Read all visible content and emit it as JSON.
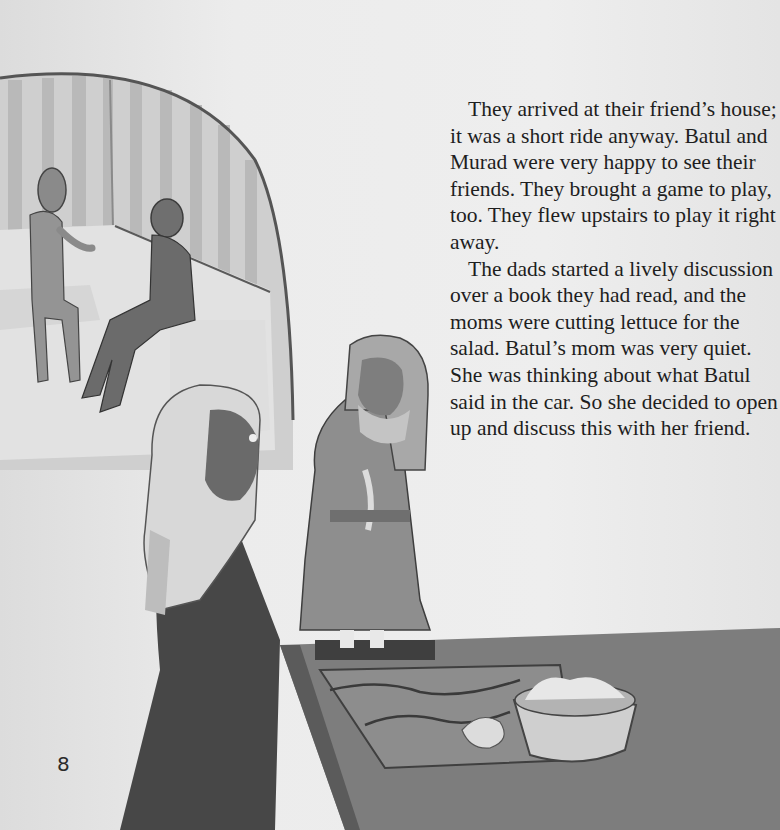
{
  "page": {
    "number": "8",
    "color_mode": "grayscale",
    "background": "#e9e9e9"
  },
  "story": {
    "paragraphs": [
      "They arrived at their friend’s house; it was a short ride anyway. Batul and Murad were very happy to see their friends. They brought a game to play, too. They flew upstairs to play it right away.",
      "The dads started a lively discussion over a book they had read, and the moms were cutting lettuce for the salad. Batul’s mom was very quiet. She was thinking about what Batul said in the car. So she decided to open up and discuss this with her friend."
    ]
  },
  "illustration": {
    "scene": "kitchen with two women in headscarves at a counter; arched doorway showing two men talking on a sofa",
    "elements": [
      "arched-doorway",
      "two-men-on-sofa",
      "woman-in-light-headscarf",
      "woman-holding-tray",
      "tray-with-cups",
      "kitchen-counter",
      "salad-bowl",
      "cutting-board"
    ]
  }
}
